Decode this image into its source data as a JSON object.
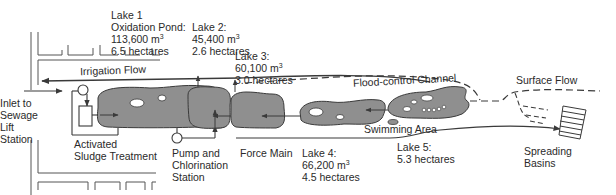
{
  "colors": {
    "lake_fill": "#8f8f8f",
    "line": "#3a3a3a",
    "text": "#2a2a2a",
    "background": "#ffffff"
  },
  "labels": {
    "lake1": {
      "title": "Lake 1",
      "subtitle": "Oxidation Pond:",
      "volume": "113,600 m",
      "volume_unit_sup": "3",
      "area": "6.5 hectares"
    },
    "lake2": {
      "title": "Lake 2:",
      "volume": "45,400 m",
      "volume_unit_sup": "3",
      "area": "2.6 hectares"
    },
    "lake3": {
      "title": "Lake 3:",
      "volume": "60,100 m",
      "volume_unit_sup": "3",
      "area": "3.0 hectares"
    },
    "lake4": {
      "title": "Lake 4:",
      "volume": "66,200 m",
      "volume_unit_sup": "3",
      "area": "4.5 hectares"
    },
    "lake5": {
      "title": "Lake 5:",
      "area": "5.3 hectares"
    },
    "irrigation_flow": "Irrigation Flow",
    "flood_control_channel": "Flood-control Channel",
    "surface_flow": "Surface Flow",
    "inlet": [
      "Inlet to",
      "Sewage",
      "Lift",
      "Station"
    ],
    "activated_sludge": [
      "Activated",
      "Sludge Treatment"
    ],
    "pump_station": [
      "Pump and",
      "Chlorination",
      "Station"
    ],
    "force_main": "Force Main",
    "swimming_area": "Swimming Area",
    "spreading_basins": [
      "Spreading",
      "Basins"
    ]
  }
}
